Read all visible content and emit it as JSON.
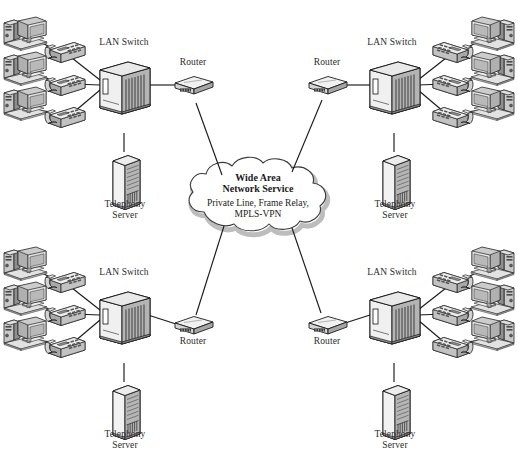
{
  "diagram": {
    "background_color": "#ffffff",
    "line_color": "#1a1a1a",
    "device_fill": "#d9d9d9",
    "device_shade": "#9a9a9a",
    "cloud_shadow": "#bdbdbd"
  },
  "cloud": {
    "name": "wan-cloud",
    "title_line1": "Wide Area",
    "title_line2": "Network Service",
    "services_line1": "Private Line, Frame Relay,",
    "services_line2": "MPLS-VPN"
  },
  "sites": [
    {
      "id": "top-left",
      "switch_label": "LAN Switch",
      "router_label": "Router",
      "server_label": "Telephony\nServer",
      "workstations": 3,
      "phones": 3
    },
    {
      "id": "top-right",
      "switch_label": "LAN Switch",
      "router_label": "Router",
      "server_label": "Telephony\nServer",
      "workstations": 3,
      "phones": 3
    },
    {
      "id": "bottom-left",
      "switch_label": "LAN Switch",
      "router_label": "Router",
      "server_label": "Telephony\nServer",
      "workstations": 3,
      "phones": 3
    },
    {
      "id": "bottom-right",
      "switch_label": "LAN Switch",
      "router_label": "Router",
      "server_label": "Telephony\nServer",
      "workstations": 3,
      "phones": 3
    }
  ]
}
